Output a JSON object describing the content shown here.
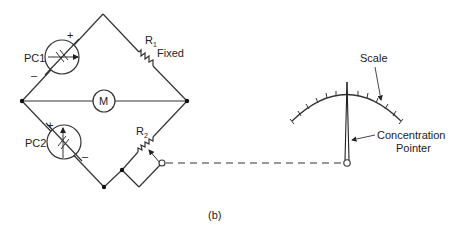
{
  "figure": {
    "caption": "(b)",
    "components": {
      "pc1": {
        "label": "PC1",
        "plus": "+",
        "minus": "–"
      },
      "pc2": {
        "label": "PC2",
        "plus": "+",
        "minus": "–"
      },
      "meter": {
        "label": "M"
      },
      "r1": {
        "label": "R",
        "subscript": "1",
        "note": "Fixed"
      },
      "r2": {
        "label": "R",
        "subscript": "2"
      }
    },
    "gauge": {
      "scale_label": "Scale",
      "pointer_label_line1": "Concentration",
      "pointer_label_line2": "Pointer"
    }
  }
}
